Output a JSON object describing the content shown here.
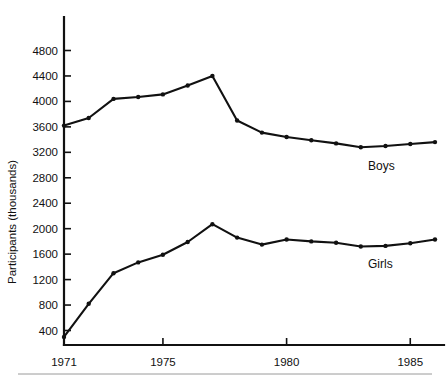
{
  "chart_data": {
    "type": "line",
    "title": "",
    "xlabel": "",
    "ylabel": "Participants  (thousands)",
    "xlim": [
      1971,
      1986
    ],
    "ylim": [
      0,
      5000
    ],
    "grid": false,
    "legend_position": "inline-right",
    "x": [
      1971,
      1972,
      1973,
      1974,
      1975,
      1976,
      1977,
      1978,
      1979,
      1980,
      1981,
      1982,
      1983,
      1984,
      1985,
      1986
    ],
    "xticks": [
      1971,
      1975,
      1980,
      1985
    ],
    "xtick_labels": [
      "1971",
      "1975",
      "1980",
      "1985"
    ],
    "yticks": [
      400,
      800,
      1200,
      1600,
      2000,
      2400,
      2800,
      3200,
      3600,
      4000,
      4400,
      4800
    ],
    "ytick_labels": [
      "400",
      "800",
      "1200",
      "1600",
      "2000",
      "2400",
      "2800",
      "3200",
      "3600",
      "4000",
      "4400",
      "4800"
    ],
    "series": [
      {
        "name": "Boys",
        "label": "Boys",
        "color": "#111111",
        "values": [
          3620,
          3740,
          4040,
          4070,
          4110,
          4250,
          4400,
          3700,
          3510,
          3440,
          3390,
          3340,
          3280,
          3300,
          3330,
          3360
        ]
      },
      {
        "name": "Girls",
        "label": "Girls",
        "color": "#111111",
        "values": [
          300,
          820,
          1300,
          1470,
          1590,
          1790,
          2070,
          1860,
          1750,
          1830,
          1800,
          1780,
          1720,
          1730,
          1770,
          1830
        ]
      }
    ]
  },
  "labels": {
    "y_axis_title": "Participants  (thousands)",
    "boys_label": "Boys",
    "girls_label": "Girls"
  }
}
